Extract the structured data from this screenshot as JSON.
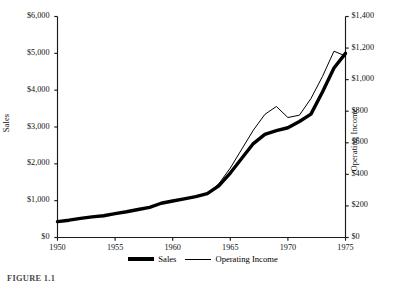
{
  "chart_data": {
    "type": "line",
    "title": "",
    "xlabel": "",
    "ylabel": "Sales",
    "y2label": "Operating Income",
    "xlim": [
      1950,
      1975
    ],
    "ylim": [
      0,
      6000
    ],
    "y2lim": [
      0,
      1400
    ],
    "grid": false,
    "legend_position": "bottom-center",
    "x_ticks": [
      "1950",
      "1955",
      "1960",
      "1965",
      "1970",
      "1975"
    ],
    "x_tick_values": [
      1950,
      1955,
      1960,
      1965,
      1970,
      1975
    ],
    "y_ticks": [
      "$0",
      "$1,000",
      "$2,000",
      "$3,000",
      "$4,000",
      "$5,000",
      "$6,000"
    ],
    "y_tick_values": [
      0,
      1000,
      2000,
      3000,
      4000,
      5000,
      6000
    ],
    "y2_ticks": [
      "$0",
      "$200",
      "$400",
      "$600",
      "$800",
      "$1,000",
      "$1,200",
      "$1,400"
    ],
    "y2_tick_values": [
      0,
      200,
      400,
      600,
      800,
      1000,
      1200,
      1400
    ],
    "x": [
      1950,
      1951,
      1952,
      1953,
      1954,
      1955,
      1956,
      1957,
      1958,
      1959,
      1960,
      1961,
      1962,
      1963,
      1964,
      1965,
      1966,
      1967,
      1968,
      1969,
      1970,
      1971,
      1972,
      1973,
      1974,
      1975
    ],
    "series": [
      {
        "name": "Sales",
        "axis": "left",
        "style": "thick",
        "values": [
          430,
          470,
          520,
          560,
          590,
          650,
          700,
          760,
          820,
          930,
          990,
          1050,
          1110,
          1190,
          1400,
          1750,
          2150,
          2550,
          2800,
          2900,
          2980,
          3150,
          3350,
          3950,
          4600,
          5000
        ]
      },
      {
        "name": "Operating Income",
        "axis": "right",
        "style": "thin",
        "values": [
          100,
          110,
          122,
          130,
          138,
          152,
          163,
          177,
          191,
          217,
          231,
          245,
          259,
          278,
          340,
          440,
          560,
          680,
          780,
          830,
          760,
          775,
          880,
          1020,
          1180,
          1150
        ]
      }
    ]
  },
  "legend": {
    "entries": [
      {
        "label": "Sales",
        "marker": "thick-line-swatch"
      },
      {
        "label": "Operating Income",
        "marker": "thin-line-swatch"
      }
    ]
  },
  "caption": {
    "text": "FIGURE 1.1"
  }
}
